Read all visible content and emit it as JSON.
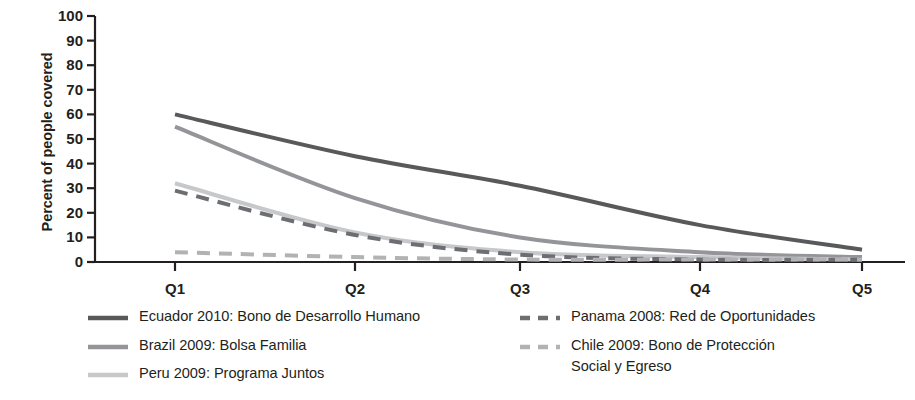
{
  "chart_data": {
    "type": "line",
    "title": "",
    "subtitle": "",
    "xlabel": "",
    "ylabel": "Percent of people covered",
    "categories": [
      "Q1",
      "Q2",
      "Q3",
      "Q4",
      "Q5"
    ],
    "x_tick_labels": [
      "Q1",
      "Q2",
      "Q3",
      "Q4",
      "Q5"
    ],
    "y_tick_labels": [
      "100",
      "90",
      "80",
      "70",
      "60",
      "50",
      "40",
      "30",
      "20",
      "10",
      "0"
    ],
    "y_ticks": [
      100,
      90,
      80,
      70,
      60,
      50,
      40,
      30,
      20,
      10,
      0
    ],
    "ylim": [
      0,
      100
    ],
    "grid": false,
    "legend_position": "bottom",
    "series": [
      {
        "name": "Ecuador 2010:  Bono de Desarrollo Humano",
        "values": [
          60,
          43,
          31,
          15,
          5
        ],
        "color": "#58595b",
        "style": "solid",
        "width": 4
      },
      {
        "name": "Brazil 2009:  Bolsa Familia",
        "values": [
          55,
          26,
          10,
          4,
          2
        ],
        "color": "#939598",
        "style": "solid",
        "width": 4
      },
      {
        "name": "Peru 2009: Programa Juntos",
        "values": [
          32,
          12,
          4,
          2,
          1
        ],
        "color": "#c7c8ca",
        "style": "solid",
        "width": 4
      },
      {
        "name": "Panama 2008: Red de Oportunidades",
        "values": [
          29,
          11,
          3,
          1,
          1
        ],
        "color": "#6d6e71",
        "style": "dashed",
        "width": 4
      },
      {
        "name": "Chile 2009:  Bono de Protección\nSocial y Egreso",
        "values": [
          4,
          2,
          1,
          1,
          1
        ],
        "color": "#b0b2b4",
        "style": "dashed",
        "width": 4
      }
    ]
  },
  "axes": {
    "y_title": "Percent of people covered",
    "y_labels": [
      "100",
      "90",
      "80",
      "70",
      "60",
      "50",
      "40",
      "30",
      "20",
      "10",
      "0"
    ],
    "x_labels": [
      "Q1",
      "Q2",
      "Q3",
      "Q4",
      "Q5"
    ],
    "axis_color": "#231f20"
  },
  "legend": {
    "left_column": [
      {
        "label": "Ecuador 2010:  Bono de Desarrollo Humano",
        "color": "#58595b",
        "style": "solid",
        "swatch_name": "legend-swatch-ecuador"
      },
      {
        "label": "Brazil 2009:  Bolsa Familia",
        "color": "#939598",
        "style": "solid",
        "swatch_name": "legend-swatch-brazil"
      },
      {
        "label": "Peru 2009: Programa Juntos",
        "color": "#c7c8ca",
        "style": "solid",
        "swatch_name": "legend-swatch-peru"
      }
    ],
    "right_column": [
      {
        "label": "Panama 2008: Red de Oportunidades",
        "color": "#6d6e71",
        "style": "dashed",
        "swatch_name": "legend-swatch-panama"
      },
      {
        "label": "Chile 2009:  Bono de Protección\nSocial y Egreso",
        "color": "#b0b2b4",
        "style": "dashed",
        "swatch_name": "legend-swatch-chile"
      }
    ]
  }
}
